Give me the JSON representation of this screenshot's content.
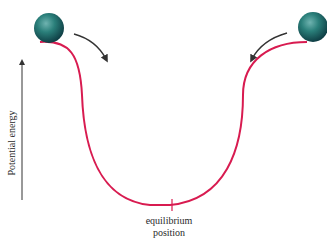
{
  "diagram": {
    "axis_label": "Potential energy",
    "equilibrium_label_line1": "equilibrium",
    "equilibrium_label_line2": "position",
    "colors": {
      "curve": "#d81b50",
      "ball": "#1f6f6a",
      "arrow": "#333333",
      "text": "#2a2a2a"
    }
  }
}
